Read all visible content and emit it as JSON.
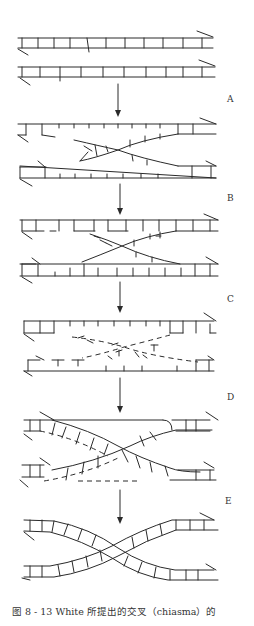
{
  "figure": {
    "caption": "图 8 - 13   White 所提出的交叉（chiasma）的",
    "stage_labels": [
      "A",
      "B",
      "C",
      "D",
      "E"
    ]
  },
  "colors": {
    "ink": "#2a2a2a",
    "background": "#ffffff"
  }
}
